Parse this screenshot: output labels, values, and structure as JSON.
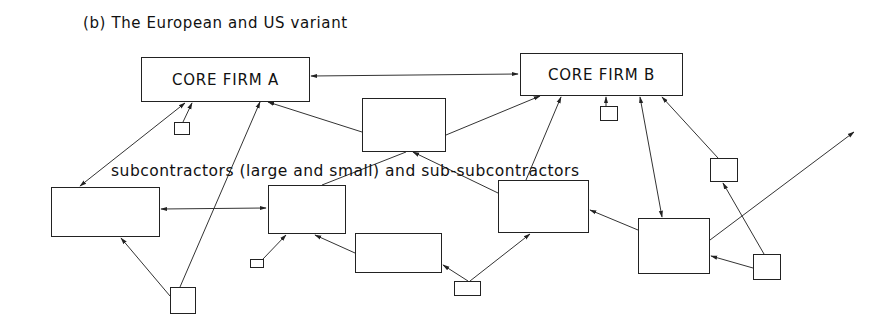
{
  "title": "(b) The European and US variant",
  "label": "subcontractors (large and small) and sub-subcontractors",
  "nodes": {
    "core_a": {
      "label": "CORE FIRM A",
      "x": 141,
      "y": 57,
      "w": 169,
      "h": 45
    },
    "core_b": {
      "label": "CORE FIRM B",
      "x": 520,
      "y": 53,
      "w": 163,
      "h": 43
    },
    "small_under_a": {
      "label": "",
      "x": 174,
      "y": 122,
      "w": 16,
      "h": 13
    },
    "mid_upper": {
      "label": "",
      "x": 362,
      "y": 98,
      "w": 84,
      "h": 54
    },
    "small_under_b": {
      "label": "",
      "x": 600,
      "y": 106,
      "w": 18,
      "h": 15
    },
    "right_small": {
      "label": "",
      "x": 710,
      "y": 158,
      "w": 28,
      "h": 24
    },
    "left_big": {
      "label": "",
      "x": 51,
      "y": 187,
      "w": 109,
      "h": 50
    },
    "center_left": {
      "label": "",
      "x": 268,
      "y": 185,
      "w": 78,
      "h": 49
    },
    "center_right": {
      "label": "",
      "x": 498,
      "y": 180,
      "w": 91,
      "h": 53
    },
    "right_big": {
      "label": "",
      "x": 638,
      "y": 218,
      "w": 72,
      "h": 56
    },
    "tiny_lower_left": {
      "label": "",
      "x": 250,
      "y": 259,
      "w": 14,
      "h": 9
    },
    "below_center": {
      "label": "",
      "x": 355,
      "y": 233,
      "w": 87,
      "h": 40
    },
    "small_lower_center": {
      "label": "",
      "x": 454,
      "y": 281,
      "w": 27,
      "h": 15
    },
    "bottom_small": {
      "label": "",
      "x": 170,
      "y": 287,
      "w": 26,
      "h": 27
    },
    "right_bottom_small": {
      "label": "",
      "x": 753,
      "y": 254,
      "w": 28,
      "h": 26
    }
  },
  "edges": [
    {
      "from": "core_a",
      "to": "core_b",
      "type": "bidirectional"
    },
    {
      "from": "left_big",
      "to": "core_a",
      "type": "bidirectional"
    },
    {
      "from": "small_under_a",
      "to": "core_a",
      "type": "directed"
    },
    {
      "from": "bottom_small",
      "to": "core_a",
      "type": "directed"
    },
    {
      "from": "mid_upper",
      "to": "core_a",
      "type": "directed"
    },
    {
      "from": "mid_upper",
      "to": "core_b",
      "type": "directed"
    },
    {
      "from": "center_right",
      "to": "core_b",
      "type": "directed"
    },
    {
      "from": "small_under_b",
      "to": "core_b",
      "type": "directed"
    },
    {
      "from": "right_big",
      "to": "core_b",
      "type": "bidirectional"
    },
    {
      "from": "right_small",
      "to": "core_b",
      "type": "directed"
    },
    {
      "from": "left_big",
      "to": "center_left",
      "type": "bidirectional"
    },
    {
      "from": "center_left",
      "to": "mid_upper",
      "type": "directed"
    },
    {
      "from": "center_right",
      "to": "mid_upper",
      "type": "directed"
    },
    {
      "from": "bottom_small",
      "to": "left_big",
      "type": "directed"
    },
    {
      "from": "tiny_lower_left",
      "to": "center_left",
      "type": "directed"
    },
    {
      "from": "below_center",
      "to": "center_left",
      "type": "directed"
    },
    {
      "from": "small_lower_center",
      "to": "below_center",
      "type": "directed"
    },
    {
      "from": "small_lower_center",
      "to": "center_right",
      "type": "directed"
    },
    {
      "from": "right_big",
      "to": "center_right",
      "type": "directed"
    },
    {
      "from": "right_big",
      "to": "outside",
      "type": "directed"
    },
    {
      "from": "right_bottom_small",
      "to": "right_big",
      "type": "directed"
    },
    {
      "from": "right_bottom_small",
      "to": "right_small",
      "type": "directed"
    }
  ]
}
